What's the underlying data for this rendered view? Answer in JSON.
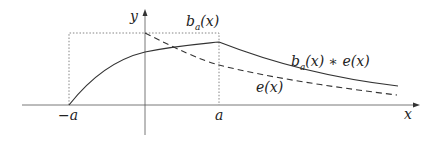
{
  "diagram": {
    "axes": {
      "x_label": "x",
      "y_label": "y"
    },
    "ticks": {
      "neg_a": "−a",
      "pos_a": "a"
    },
    "labels": {
      "box": {
        "base": "b",
        "sub": "a",
        "arg": "(x)"
      },
      "convolution": {
        "base": "b",
        "sub": "a",
        "arg": "(x) ∗ e(x)"
      },
      "exponential": "e(x)"
    },
    "curves": [
      {
        "name": "b_a(x)",
        "style": "dotted",
        "description": "box function of height 1 on [-a, a]"
      },
      {
        "name": "e(x)",
        "style": "dashed",
        "description": "decaying exponential starting at x=0"
      },
      {
        "name": "b_a(x) * e(x)",
        "style": "solid",
        "description": "convolution, rising from -a, peaking at a, then decaying"
      }
    ],
    "colors": {
      "stroke": "#333333",
      "grid": "#888888"
    }
  }
}
